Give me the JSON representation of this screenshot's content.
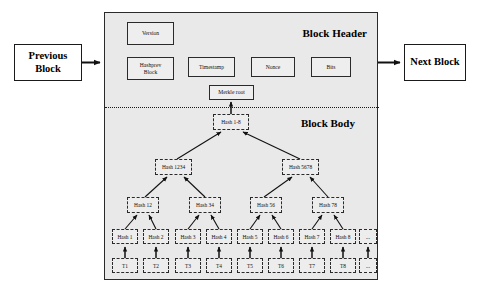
{
  "diagram": {
    "chain": {
      "previous_block_label": "Previous\nBlock",
      "previous_block_line1": "Previous",
      "previous_block_line2": "Block",
      "next_block_label": "Next Block"
    },
    "block": {
      "header_title": "Block Header",
      "body_title": "Block Body",
      "header_fields": [
        {
          "id": "version",
          "label": "Version"
        },
        {
          "id": "hashprev",
          "label_line1": "Hashprev",
          "label_line2": "Block"
        },
        {
          "id": "timestamp",
          "label": "Timestamp"
        },
        {
          "id": "nonce",
          "label": "Nonce"
        },
        {
          "id": "bits",
          "label": "Bits"
        },
        {
          "id": "merkle",
          "label": "Merkle root"
        }
      ],
      "merkle_tree": {
        "root": "Hash 1-8",
        "level2": [
          "Hash 1234",
          "Hash 5678"
        ],
        "level3": [
          "Hash 12",
          "Hash 34",
          "Hash 56",
          "Hash 78"
        ],
        "leaves": [
          "Hash 1",
          "Hash 2",
          "Hash 3",
          "Hash 4",
          "Hash 5",
          "Hash 6",
          "Hash 7",
          "Hash 8"
        ],
        "leaves_overflow": "...",
        "transactions": [
          "T1",
          "T2",
          "T3",
          "T4",
          "T5",
          "T6",
          "T7",
          "T8"
        ],
        "transactions_overflow": "..."
      }
    },
    "colors": {
      "block_fill": "#e9e9e9",
      "node_fill": "#ededed",
      "stroke": "#2a2a2a",
      "text": "#000000"
    }
  }
}
